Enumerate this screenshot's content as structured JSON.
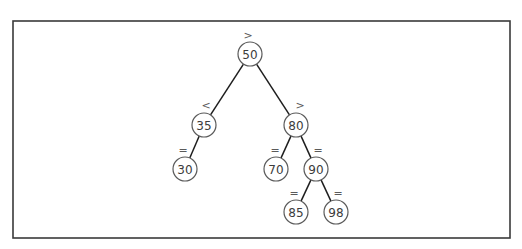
{
  "diagram": {
    "type": "binary-search-tree",
    "frame": {
      "x": 13,
      "y": 21,
      "width": 497,
      "height": 217
    },
    "node_radius": 12,
    "nodes": [
      {
        "id": "n50",
        "value": "50",
        "cx": 250,
        "cy": 54,
        "relation": ">",
        "rx": 248,
        "ry": 35
      },
      {
        "id": "n35",
        "value": "35",
        "cx": 204,
        "cy": 125,
        "relation": "<",
        "rx": 206,
        "ry": 105
      },
      {
        "id": "n80",
        "value": "80",
        "cx": 296,
        "cy": 125,
        "relation": ">",
        "rx": 300,
        "ry": 105
      },
      {
        "id": "n30",
        "value": "30",
        "cx": 185,
        "cy": 169,
        "relation": "=",
        "rx": 183,
        "ry": 150
      },
      {
        "id": "n70",
        "value": "70",
        "cx": 276,
        "cy": 169,
        "relation": "=",
        "rx": 275,
        "ry": 150
      },
      {
        "id": "n90",
        "value": "90",
        "cx": 316,
        "cy": 169,
        "relation": "=",
        "rx": 318,
        "ry": 150
      },
      {
        "id": "n85",
        "value": "85",
        "cx": 296,
        "cy": 212,
        "relation": "=",
        "rx": 294,
        "ry": 193
      },
      {
        "id": "n98",
        "value": "98",
        "cx": 336,
        "cy": 212,
        "relation": "=",
        "rx": 338,
        "ry": 193
      }
    ],
    "edges": [
      {
        "from": "n50",
        "to": "n35"
      },
      {
        "from": "n50",
        "to": "n80"
      },
      {
        "from": "n35",
        "to": "n30"
      },
      {
        "from": "n80",
        "to": "n70"
      },
      {
        "from": "n80",
        "to": "n90"
      },
      {
        "from": "n90",
        "to": "n85"
      },
      {
        "from": "n90",
        "to": "n98"
      }
    ]
  }
}
